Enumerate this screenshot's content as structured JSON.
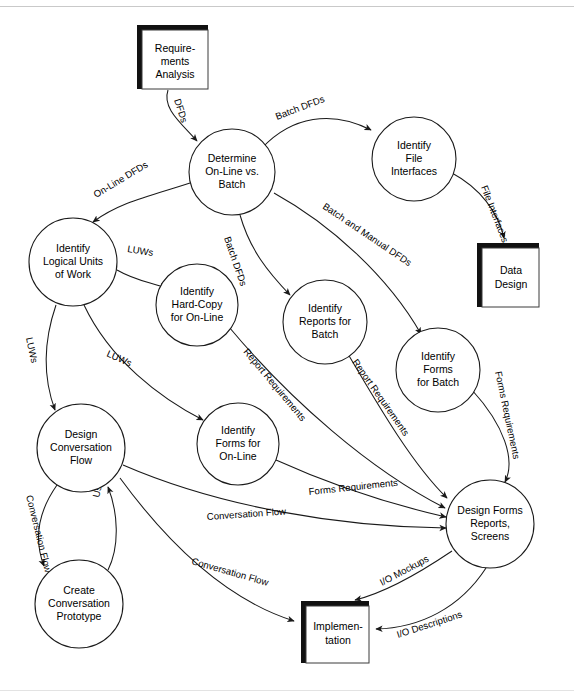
{
  "diagram": {
    "type": "data-flow-diagram",
    "background_color": "#ffffff",
    "line_color": "#1a1a1a",
    "text_color": "#000000",
    "processes": [
      {
        "id": "determine",
        "lines": [
          "Determine",
          "On-Line vs.",
          "Batch"
        ],
        "cx": 232,
        "cy": 172,
        "r": 43
      },
      {
        "id": "file_interfaces",
        "lines": [
          "Identify",
          "File",
          "Interfaces"
        ],
        "cx": 414,
        "cy": 159,
        "r": 42
      },
      {
        "id": "logical_units",
        "lines": [
          "Identify",
          "Logical Units",
          "of Work"
        ],
        "cx": 73,
        "cy": 262,
        "r": 44
      },
      {
        "id": "hard_copy",
        "lines": [
          "Identify",
          "Hard-Copy",
          "for On-Line"
        ],
        "cx": 197,
        "cy": 305,
        "r": 41
      },
      {
        "id": "reports_batch",
        "lines": [
          "Identify",
          "Reports for",
          "Batch"
        ],
        "cx": 325,
        "cy": 322,
        "r": 42
      },
      {
        "id": "forms_batch",
        "lines": [
          "Identify",
          "Forms",
          "for Batch"
        ],
        "cx": 438,
        "cy": 370,
        "r": 42
      },
      {
        "id": "design_conversation",
        "lines": [
          "Design",
          "Conversation",
          "Flow"
        ],
        "cx": 81,
        "cy": 448,
        "r": 44
      },
      {
        "id": "forms_online",
        "lines": [
          "Identify",
          "Forms for",
          "On-Line"
        ],
        "cx": 238,
        "cy": 444,
        "r": 41
      },
      {
        "id": "design_forms",
        "lines": [
          "Design Forms",
          "Reports,",
          "Screens"
        ],
        "cx": 490,
        "cy": 524,
        "r": 44
      },
      {
        "id": "create_prototype",
        "lines": [
          "Create",
          "Conversation",
          "Prototype"
        ],
        "cx": 79,
        "cy": 604,
        "r": 44
      }
    ],
    "stores": [
      {
        "id": "requirements_analysis",
        "lines": [
          "Require-",
          "ments",
          "Analysis"
        ],
        "x": 137,
        "y": 25,
        "w": 71,
        "h": 64
      },
      {
        "id": "data_design",
        "lines": [
          "Data",
          "Design"
        ],
        "x": 477,
        "y": 243,
        "w": 62,
        "h": 64
      },
      {
        "id": "implementation",
        "lines": [
          "Implemen-",
          "tation"
        ],
        "x": 301,
        "y": 601,
        "w": 68,
        "h": 62
      }
    ],
    "flows": [
      {
        "id": "f1",
        "label": "DFDs",
        "from": "requirements_analysis",
        "to": "determine"
      },
      {
        "id": "f2",
        "label": "Batch DFDs",
        "from": "determine",
        "to": "file_interfaces"
      },
      {
        "id": "f3",
        "label": "On-Line DFDs",
        "from": "determine",
        "to": "logical_units"
      },
      {
        "id": "f4",
        "label": "File Interfaces",
        "from": "file_interfaces",
        "to": "data_design"
      },
      {
        "id": "f5",
        "label": "Batch DFDs",
        "from": "determine",
        "to": "reports_batch"
      },
      {
        "id": "f6",
        "label": "Batch and Manual DFDs",
        "from": "determine",
        "to": "forms_batch"
      },
      {
        "id": "f7",
        "label": "LUWs",
        "from": "logical_units",
        "to": "hard_copy"
      },
      {
        "id": "f8",
        "label": "LUWs",
        "from": "logical_units",
        "to": "design_conversation"
      },
      {
        "id": "f9",
        "label": "LUWs",
        "from": "logical_units",
        "to": "forms_online"
      },
      {
        "id": "f10",
        "label": "Report Requirements",
        "from": "hard_copy",
        "to": "design_forms"
      },
      {
        "id": "f11",
        "label": "Report Requirements",
        "from": "reports_batch",
        "to": "design_forms"
      },
      {
        "id": "f12",
        "label": "Forms Requirements",
        "from": "forms_batch",
        "to": "design_forms"
      },
      {
        "id": "f13",
        "label": "Forms Requirements",
        "from": "forms_online",
        "to": "design_forms"
      },
      {
        "id": "f14",
        "label": "Conversation Flow",
        "from": "design_conversation",
        "to": "design_forms"
      },
      {
        "id": "f15",
        "label": "Conversation Flow",
        "from": "design_conversation",
        "to": "create_prototype"
      },
      {
        "id": "f16",
        "label": "User Feedback",
        "from": "create_prototype",
        "to": "design_conversation"
      },
      {
        "id": "f17",
        "label": "Conversation Flow",
        "from": "design_conversation",
        "to": "implementation"
      },
      {
        "id": "f18",
        "label": "I/O Mockups",
        "from": "design_forms",
        "to": "implementation"
      },
      {
        "id": "f19",
        "label": "I/O Descriptions",
        "from": "design_forms",
        "to": "implementation"
      }
    ]
  }
}
